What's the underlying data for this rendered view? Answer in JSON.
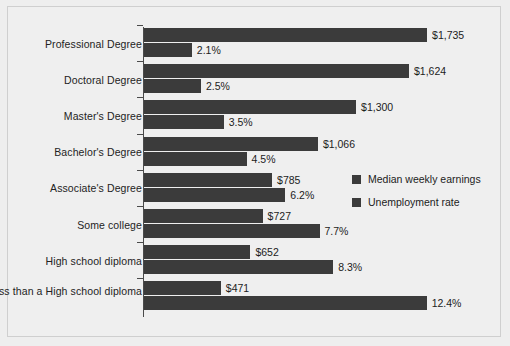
{
  "chart_data": {
    "type": "bar",
    "orientation": "horizontal",
    "title": "",
    "xlabel": "",
    "ylabel": "",
    "grid": false,
    "legend_position": "middle-right",
    "categories": [
      "Professional Degree",
      "Doctoral Degree",
      "Master's Degree",
      "Bachelor's Degree",
      "Associate's Degree",
      "Some college",
      "High school diploma",
      "Less than a High school diploma"
    ],
    "series": [
      {
        "name": "Median weekly earnings",
        "unit": "USD",
        "values": [
          1735,
          1624,
          1300,
          1066,
          785,
          727,
          652,
          471
        ],
        "labels": [
          "$1,735",
          "$1,624",
          "$1,300",
          "$1,066",
          "$785",
          "$727",
          "$652",
          "$471"
        ],
        "axis_max": 1900,
        "color": "#3b3b3b"
      },
      {
        "name": "Unemployment rate",
        "unit": "percent",
        "values": [
          2.1,
          2.5,
          3.5,
          4.5,
          6.2,
          7.7,
          8.3,
          12.4
        ],
        "labels": [
          "2.1%",
          "2.5%",
          "3.5%",
          "4.5%",
          "6.2%",
          "7.7%",
          "8.3%",
          "12.4%"
        ],
        "axis_max": 13.6,
        "color": "#3b3b3b"
      }
    ]
  },
  "legend": {
    "items": [
      {
        "label": "Median weekly earnings"
      },
      {
        "label": "Unemployment rate"
      }
    ]
  }
}
